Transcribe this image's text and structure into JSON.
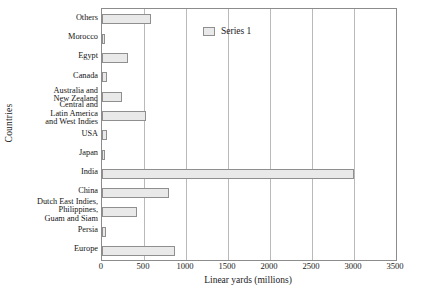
{
  "chart_data": {
    "type": "bar",
    "orientation": "horizontal",
    "title": "",
    "xlabel": "Linear yards (millions)",
    "ylabel": "Countries",
    "xlim": [
      0,
      3500
    ],
    "xticks": [
      0,
      500,
      1000,
      1500,
      2000,
      2500,
      3000,
      3500
    ],
    "grid": true,
    "legend_position": "top-right",
    "legend": [
      "Series 1"
    ],
    "series": [
      {
        "name": "Series 1",
        "values": [
          870,
          50,
          420,
          800,
          3000,
          40,
          60,
          520,
          240,
          60,
          310,
          40,
          580
        ]
      }
    ],
    "categories": [
      "Europe",
      "Persia",
      "Dutch East Indies,\nPhilippines,\nGuam and Siam",
      "China",
      "India",
      "Japan",
      "USA",
      "Central and\nLatin America\nand West Indies",
      "Australia and\nNew Zealand",
      "Canada",
      "Egypt",
      "Morocco",
      "Others"
    ],
    "colors": {
      "bar_fill": "#e9e9e9",
      "bar_border": "#8f8f8f",
      "gridline": "#b9b9b9",
      "axis": "#8c8c8c",
      "text": "#141414",
      "background": "#ffffff"
    }
  }
}
